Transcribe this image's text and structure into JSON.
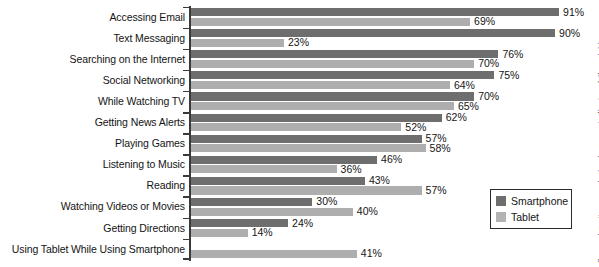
{
  "chart_data": {
    "type": "bar",
    "orientation": "horizontal",
    "title": "",
    "subtitle": "",
    "xlabel": "",
    "ylabel": "",
    "xlim": [
      0,
      100
    ],
    "grid": false,
    "value_suffix": "%",
    "legend_position": "bottom-right",
    "categories": [
      "Accessing Email",
      "Text Messaging",
      "Searching on the Internet",
      "Social Networking",
      "While Watching TV",
      "Getting News Alerts",
      "Playing Games",
      "Listening to Music",
      "Reading",
      "Watching Videos or Movies",
      "Getting Directions",
      "Using Tablet While Using Smartphone"
    ],
    "series": [
      {
        "name": "Smartphone",
        "color": "#6e6e6e",
        "values": [
          91,
          90,
          76,
          75,
          70,
          62,
          57,
          46,
          43,
          30,
          24,
          null
        ],
        "labels": [
          "91%",
          "90%",
          "76%",
          "75%",
          "70%",
          "62%",
          "57%",
          "46%",
          "43%",
          "30%",
          "24%",
          ""
        ]
      },
      {
        "name": "Tablet",
        "color": "#aeaeae",
        "values": [
          69,
          23,
          70,
          64,
          65,
          52,
          58,
          36,
          57,
          40,
          14,
          41
        ],
        "labels": [
          "69%",
          "23%",
          "70%",
          "64%",
          "65%",
          "52%",
          "58%",
          "36%",
          "57%",
          "40%",
          "14%",
          "41%"
        ]
      }
    ]
  },
  "legend": {
    "items": [
      {
        "label": "Smartphone",
        "color": "#6e6e6e"
      },
      {
        "label": "Tablet",
        "color": "#b3b3b3"
      }
    ]
  },
  "source": {
    "text": "Source: http://www.marketingcharts.com/online/top-daily-activities-o"
  }
}
